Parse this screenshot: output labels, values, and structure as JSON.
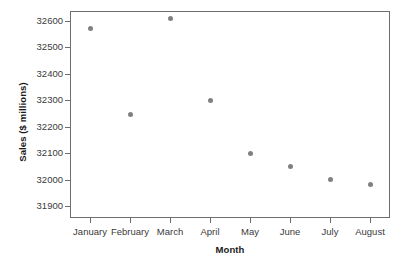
{
  "chart_data": {
    "type": "scatter",
    "title": "",
    "xlabel": "Month",
    "ylabel": "Sales ($ millions)",
    "categories": [
      "January",
      "February",
      "March",
      "April",
      "May",
      "June",
      "July",
      "August"
    ],
    "values": [
      32572,
      32248,
      32610,
      32300,
      32100,
      32050,
      32000,
      31982
    ],
    "series": [
      {
        "name": "Sales",
        "values": [
          32572,
          32248,
          32610,
          32300,
          32100,
          32050,
          32000,
          31982
        ]
      }
    ],
    "y_ticks": [
      31900,
      32000,
      32100,
      32200,
      32300,
      32400,
      32500,
      32600
    ],
    "y_tick_labels": [
      "31900",
      "32000",
      "32100",
      "32200",
      "32300",
      "32400",
      "32500",
      "32600"
    ],
    "ylim": [
      31855,
      32638
    ],
    "grid": false,
    "legend": false,
    "marker_color": "#808080",
    "axis_color": "#6e6e6e",
    "background_color": "#ffffff"
  }
}
